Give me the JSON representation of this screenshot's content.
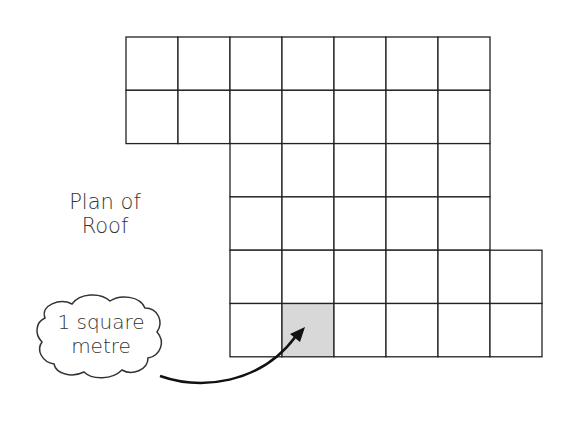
{
  "title": {
    "line1": "Plan of",
    "line2": "Roof"
  },
  "callout": {
    "line1": "1 square",
    "line2": "metre"
  },
  "grid": {
    "origin_x": 126,
    "origin_y": 37,
    "cell_w": 52,
    "cell_h": 53.3,
    "rows": [
      {
        "start_col": 0,
        "end_col": 7
      },
      {
        "start_col": 0,
        "end_col": 7
      },
      {
        "start_col": 2,
        "end_col": 7
      },
      {
        "start_col": 2,
        "end_col": 7
      },
      {
        "start_col": 2,
        "end_col": 8
      },
      {
        "start_col": 2,
        "end_col": 8
      }
    ],
    "shaded_cell": {
      "row": 5,
      "col": 3
    },
    "line_color": "#222222",
    "shade_color": "#d8d8d8"
  }
}
